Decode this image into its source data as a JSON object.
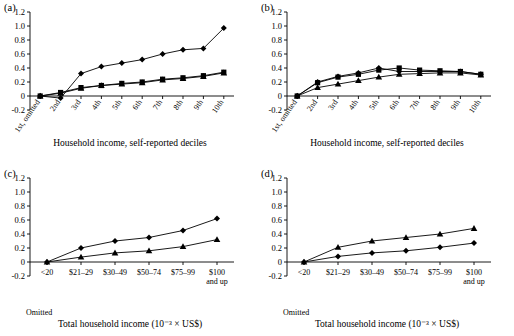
{
  "figure": {
    "panels": [
      {
        "tag": "(a)",
        "xlabel": "Household income, self-reported deciles",
        "ylabel": "",
        "ylim": [
          -0.2,
          1.2
        ],
        "yticks": [
          "-0.2",
          "0",
          "0.2",
          "0.4",
          "0.6",
          "0.8",
          "1.0",
          "1.2"
        ],
        "xticks": [
          "1st, omitted",
          "2nd",
          "3rd",
          "4th",
          "5th",
          "6th",
          "7th",
          "8th",
          "9th",
          "10th"
        ],
        "omitted_note": "",
        "series": [
          {
            "name": "diamond",
            "marker": "diamond",
            "values": [
              0,
              -0.03,
              0.32,
              0.42,
              0.47,
              0.52,
              0.6,
              0.66,
              0.68,
              0.97
            ]
          },
          {
            "name": "square",
            "marker": "square",
            "values": [
              0,
              0.05,
              0.12,
              0.15,
              0.18,
              0.2,
              0.24,
              0.26,
              0.29,
              0.34
            ]
          },
          {
            "name": "triangle",
            "marker": "triangle",
            "values": [
              0,
              0.04,
              0.11,
              0.15,
              0.17,
              0.19,
              0.23,
              0.25,
              0.28,
              0.33
            ]
          }
        ]
      },
      {
        "tag": "(b)",
        "xlabel": "Household income, self-reported deciles",
        "ylabel": "",
        "ylim": [
          -0.2,
          1.2
        ],
        "yticks": [
          "-0.2",
          "0",
          "0.2",
          "0.4",
          "0.6",
          "0.8",
          "1.0",
          "1.2"
        ],
        "xticks": [
          "1st, omitted",
          "2nd",
          "3rd",
          "4th",
          "5th",
          "6th",
          "7th",
          "8th",
          "9th",
          "10th"
        ],
        "omitted_note": "",
        "series": [
          {
            "name": "diamond",
            "marker": "diamond",
            "values": [
              0,
              0.2,
              0.28,
              0.33,
              0.4,
              0.35,
              0.35,
              0.35,
              0.35,
              0.31
            ]
          },
          {
            "name": "square",
            "marker": "square",
            "values": [
              0,
              0.19,
              0.27,
              0.31,
              0.37,
              0.4,
              0.37,
              0.36,
              0.35,
              0.31
            ]
          },
          {
            "name": "triangle",
            "marker": "triangle",
            "values": [
              0,
              0.12,
              0.17,
              0.22,
              0.27,
              0.31,
              0.32,
              0.33,
              0.33,
              0.3
            ]
          }
        ]
      },
      {
        "tag": "(c)",
        "xlabel": "Total household income (10⁻³ × US$)",
        "ylabel": "",
        "ylim": [
          -0.2,
          1.2
        ],
        "yticks": [
          "-0.2",
          "0",
          "0.2",
          "0.4",
          "0.6",
          "0.8",
          "1.0",
          "1.2"
        ],
        "xticks": [
          "<20",
          "$21–29",
          "$30–49",
          "$50–74",
          "$75–99",
          "$100\nand up"
        ],
        "omitted_note": "Omitted",
        "series": [
          {
            "name": "diamond",
            "marker": "diamond",
            "values": [
              0,
              0.2,
              0.3,
              0.35,
              0.45,
              0.62
            ]
          },
          {
            "name": "triangle",
            "marker": "triangle",
            "values": [
              0,
              0.07,
              0.13,
              0.16,
              0.22,
              0.32
            ]
          }
        ]
      },
      {
        "tag": "(d)",
        "xlabel": "Total household income (10⁻³ × US$)",
        "ylabel": "",
        "ylim": [
          -0.2,
          1.2
        ],
        "yticks": [
          "-0.2",
          "0",
          "0.2",
          "0.4",
          "0.6",
          "0.8",
          "1.0",
          "1.2"
        ],
        "xticks": [
          "<20",
          "$21–29",
          "$30–49",
          "$50–74",
          "$75–99",
          "$100\nand up"
        ],
        "omitted_note": "Omitted",
        "series": [
          {
            "name": "triangle",
            "marker": "triangle",
            "values": [
              0,
              0.21,
              0.3,
              0.35,
              0.4,
              0.48
            ]
          },
          {
            "name": "diamond",
            "marker": "diamond",
            "values": [
              0,
              0.08,
              0.13,
              0.16,
              0.21,
              0.27
            ]
          }
        ]
      }
    ]
  },
  "chart_data": {
    "type": "line",
    "title": "",
    "panels": [
      {
        "id": "a",
        "xlabel": "Household income, self-reported deciles",
        "ylabel": "",
        "ylim": [
          -0.2,
          1.2
        ],
        "categories": [
          "1st, omitted",
          "2nd",
          "3rd",
          "4th",
          "5th",
          "6th",
          "7th",
          "8th",
          "9th",
          "10th"
        ],
        "series": [
          {
            "name": "diamond",
            "values": [
              0,
              -0.03,
              0.32,
              0.42,
              0.47,
              0.52,
              0.6,
              0.66,
              0.68,
              0.97
            ]
          },
          {
            "name": "square",
            "values": [
              0,
              0.05,
              0.12,
              0.15,
              0.18,
              0.2,
              0.24,
              0.26,
              0.29,
              0.34
            ]
          },
          {
            "name": "triangle",
            "values": [
              0,
              0.04,
              0.11,
              0.15,
              0.17,
              0.19,
              0.23,
              0.25,
              0.28,
              0.33
            ]
          }
        ]
      },
      {
        "id": "b",
        "xlabel": "Household income, self-reported deciles",
        "ylabel": "",
        "ylim": [
          -0.2,
          1.2
        ],
        "categories": [
          "1st, omitted",
          "2nd",
          "3rd",
          "4th",
          "5th",
          "6th",
          "7th",
          "8th",
          "9th",
          "10th"
        ],
        "series": [
          {
            "name": "diamond",
            "values": [
              0,
              0.2,
              0.28,
              0.33,
              0.4,
              0.35,
              0.35,
              0.35,
              0.35,
              0.31
            ]
          },
          {
            "name": "square",
            "values": [
              0,
              0.19,
              0.27,
              0.31,
              0.37,
              0.4,
              0.37,
              0.36,
              0.35,
              0.31
            ]
          },
          {
            "name": "triangle",
            "values": [
              0,
              0.12,
              0.17,
              0.22,
              0.27,
              0.31,
              0.32,
              0.33,
              0.33,
              0.3
            ]
          }
        ]
      },
      {
        "id": "c",
        "xlabel": "Total household income (10⁻³ × US$)",
        "ylabel": "",
        "ylim": [
          -0.2,
          1.2
        ],
        "categories": [
          "<20",
          "$21–29",
          "$30–49",
          "$50–74",
          "$75–99",
          "$100 and up"
        ],
        "series": [
          {
            "name": "diamond",
            "values": [
              0,
              0.2,
              0.3,
              0.35,
              0.45,
              0.62
            ]
          },
          {
            "name": "triangle",
            "values": [
              0,
              0.07,
              0.13,
              0.16,
              0.22,
              0.32
            ]
          }
        ]
      },
      {
        "id": "d",
        "xlabel": "Total household income (10⁻³ × US$)",
        "ylabel": "",
        "ylim": [
          -0.2,
          1.2
        ],
        "categories": [
          "<20",
          "$21–29",
          "$30–49",
          "$50–74",
          "$75–99",
          "$100 and up"
        ],
        "series": [
          {
            "name": "triangle",
            "values": [
              0,
              0.21,
              0.3,
              0.35,
              0.4,
              0.48
            ]
          },
          {
            "name": "diamond",
            "values": [
              0,
              0.08,
              0.13,
              0.16,
              0.21,
              0.27
            ]
          }
        ]
      }
    ]
  }
}
